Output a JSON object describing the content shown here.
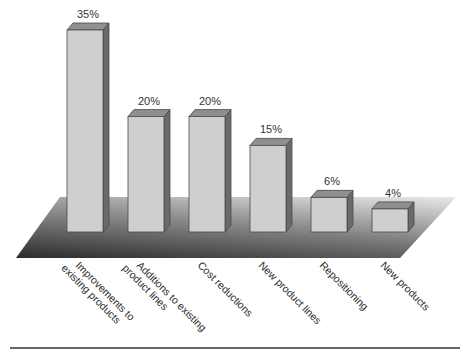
{
  "chart_data": {
    "type": "bar",
    "title": "",
    "xlabel": "",
    "ylabel": "",
    "categories": [
      "Improvements to existing products",
      "Additions to existing product lines",
      "Cost reductions",
      "New product lines",
      "Repositioning",
      "New products"
    ],
    "category_lines": [
      [
        "Improvements to",
        "existing products"
      ],
      [
        "Additions to existing",
        "product lines"
      ],
      [
        "Cost reductions"
      ],
      [
        "New product lines"
      ],
      [
        "Repositioning"
      ],
      [
        "New products"
      ]
    ],
    "values": [
      35,
      20,
      20,
      15,
      6,
      4
    ],
    "value_labels": [
      "35%",
      "20%",
      "20%",
      "15%",
      "6%",
      "4%"
    ],
    "unit": "%",
    "ylim": [
      0,
      35
    ],
    "grid": false,
    "legend": null,
    "style": "3d-bars-on-gradient-floor",
    "colors": {
      "bar_front": "#cfcfcf",
      "bar_top": "#8f8f8f",
      "bar_side": "#6a6a6a",
      "bar_outline": "#4a4a4a",
      "floor_dark": "#3f3f3f",
      "floor_light": "#d8d8d8",
      "rule": "#333333"
    }
  }
}
